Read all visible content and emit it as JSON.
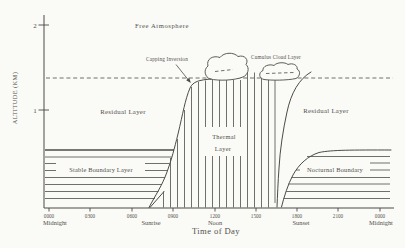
{
  "figure_title": "Diurnal evolution of the atmospheric boundary layer",
  "colors": {
    "bg": "#fafaf7",
    "ink": "#4c4b46",
    "text": "#53514b"
  },
  "canvas": {
    "width": 405,
    "height": 248
  },
  "y_axis": {
    "label": "ALTITUDE (KM)",
    "x": 44,
    "y1": 15,
    "y2": 208,
    "ticks": [
      {
        "label": "2",
        "y": 25
      },
      {
        "label": "1",
        "y": 110
      }
    ]
  },
  "x_axis": {
    "title": "Time of Day",
    "y": 208,
    "x1": 44,
    "x2": 394,
    "ticks": [
      {
        "label": "0000",
        "x": 49
      },
      {
        "label": "0300",
        "x": 90
      },
      {
        "label": "0600",
        "x": 132
      },
      {
        "label": "0900",
        "x": 173
      },
      {
        "label": "1200",
        "x": 215
      },
      {
        "label": "1500",
        "x": 256
      },
      {
        "label": "1800",
        "x": 297
      },
      {
        "label": "2100",
        "x": 338
      },
      {
        "label": "0000",
        "x": 380
      }
    ],
    "sub_labels": [
      {
        "text": "Midnight",
        "x": 55
      },
      {
        "text": "Sunrise",
        "x": 151
      },
      {
        "text": "Noon",
        "x": 215
      },
      {
        "text": "Sunset",
        "x": 301
      },
      {
        "text": "Midnight",
        "x": 381
      }
    ]
  },
  "region_labels": [
    {
      "name": "free-atmosphere-label",
      "text": "Free Atmosphere",
      "x": 162,
      "y": 27.5,
      "size": 6.6,
      "spacing": 0.6
    },
    {
      "name": "capping-inversion-label",
      "text": "Capping Inversion",
      "x": 167,
      "y": 60.5,
      "size": 5.2,
      "spacing": 0.2
    },
    {
      "name": "cumulus-cloud-layer-label",
      "text": "Cumulus Cloud Layer",
      "x": 276,
      "y": 58.5,
      "size": 5.2,
      "spacing": 0.2
    },
    {
      "name": "residual-layer-left-label",
      "text": "Residual Layer",
      "x": 123,
      "y": 113.5,
      "size": 6.8,
      "spacing": 0.3
    },
    {
      "name": "residual-layer-right-label",
      "text": "Residual Layer",
      "x": 326,
      "y": 112.5,
      "size": 6.8,
      "spacing": 0.3
    },
    {
      "name": "thermal-layer-label-line1",
      "text": "Thermal",
      "x": 224,
      "y": 138.5,
      "size": 6.4,
      "spacing": 0.3
    },
    {
      "name": "thermal-layer-label-line2",
      "text": "Layer",
      "x": 223,
      "y": 150.5,
      "size": 6.4,
      "spacing": 0.3
    },
    {
      "name": "stable-boundary-layer-label",
      "text": "Stable Boundary Layer",
      "x": 101,
      "y": 172,
      "size": 6.4,
      "spacing": 0.2
    },
    {
      "name": "nocturnal-boundary-label",
      "text": "Nocturnal Boundary",
      "x": 335,
      "y": 172,
      "size": 6.4,
      "spacing": 0.2
    }
  ],
  "geometry": {
    "dashed_line": {
      "x1": 46,
      "y": 78,
      "x2": 393
    },
    "stable_x1": 45,
    "stable_lines": [
      {
        "y": 150,
        "x2": 174,
        "w": 1.6
      },
      {
        "y": 157,
        "x2": 171.5
      },
      {
        "y": 163.5,
        "x2": 169.5
      },
      {
        "y": 170.5,
        "x2": 167.5
      },
      {
        "y": 177.5,
        "x2": 165
      },
      {
        "y": 184.5,
        "x2": 162
      },
      {
        "y": 191.5,
        "x2": 158.5
      },
      {
        "y": 198.5,
        "x2": 155
      }
    ],
    "nocturnal_x2": 390,
    "nocturnal_lines": [
      {
        "y": 156.5,
        "x1": 307
      },
      {
        "y": 163,
        "x1": 301
      },
      {
        "y": 170,
        "x1": 296
      },
      {
        "y": 177.5,
        "x1": 291.5
      },
      {
        "y": 184,
        "x1": 288.5
      },
      {
        "y": 191.5,
        "x1": 286
      },
      {
        "y": 198.5,
        "x1": 283.5
      }
    ],
    "thermal_y2": 207.5,
    "thermal_lines": [
      {
        "x": 163.5,
        "y1": 191.5
      },
      {
        "x": 170.5,
        "y1": 158
      },
      {
        "x": 177.5,
        "y1": 139
      },
      {
        "x": 184.5,
        "y1": 110
      },
      {
        "x": 191.5,
        "y1": 87
      },
      {
        "x": 198.5,
        "y1": 82
      },
      {
        "x": 205.5,
        "y1": 80.5
      },
      {
        "x": 212.5,
        "y1": 80
      },
      {
        "x": 219.5,
        "y1": 80
      },
      {
        "x": 226.5,
        "y1": 80
      },
      {
        "x": 233.5,
        "y1": 80
      },
      {
        "x": 240.5,
        "y1": 80
      },
      {
        "x": 247.5,
        "y1": 72.5
      },
      {
        "x": 254.5,
        "y1": 72.5
      },
      {
        "x": 261.5,
        "y1": 73
      },
      {
        "x": 268.5,
        "y1": 80
      },
      {
        "x": 275,
        "y1": 80,
        "y2": 203
      }
    ],
    "masks": [
      {
        "x": 204,
        "y": 127,
        "w": 40,
        "h": 29
      },
      {
        "x": 56,
        "y": 162,
        "w": 89,
        "h": 14.5
      },
      {
        "x": 300,
        "y": 161,
        "w": 70,
        "h": 15.5
      }
    ],
    "clouds": [
      {
        "name": "cumulus-cloud-left",
        "d": "M210,79 C205,77 203,70 208,66 C206,59 213,55 220,57.5 C224,52 234,52 238,56.5 C245,54.5 249,60 246,64.5 C250,68 248,75 243,77 C234,80.5 219,81 210,79 Z"
      },
      {
        "name": "cumulus-cloud-right",
        "d": "M264,79.5 C259,78.5 258,72.5 263,70.5 C262,66.5 269,63.5 274,65.5 C277,62 285,62 288,64.5 C293,62.5 298,65.5 297,69 C301,71 300,76.5 296,78.5 C287,80.5 271,80.5 264,79.5 Z"
      }
    ],
    "cloud_dashes": [
      {
        "x1": 215,
        "y1": 71.5,
        "x2": 233,
        "y2": 69.5
      },
      {
        "x1": 266,
        "y1": 73.5,
        "x2": 294,
        "y2": 72.5
      }
    ],
    "curves": [
      {
        "name": "morning-growth-curve",
        "d": "M149,207.5 C156,194 162,186 167,172 C172,158 174,150 178,134 C183,113 185,100 190,88 C193,81.5 199,80 211,79"
      },
      {
        "name": "sunrise-shallow-layer-line",
        "d": "M150,207.5 L164,191.5"
      },
      {
        "name": "evening-decay-curve",
        "d": "M311,72 C299,79 291,93 287,112 C283,130 280,150 279,168 C278,182 277.5,196 277,207"
      },
      {
        "name": "nocturnal-growth-curve",
        "d": "M281.5,207 C284,197 288,184 293,175 C299,164 308,156 319,152.5 C332,149.8 352,150 391,150"
      }
    ],
    "arrow": {
      "x1": 176,
      "y1": 64.5,
      "x2": 188.8,
      "y2": 80.5,
      "head": "190.8,83 189.3,77.8 186.2,80.2"
    }
  }
}
